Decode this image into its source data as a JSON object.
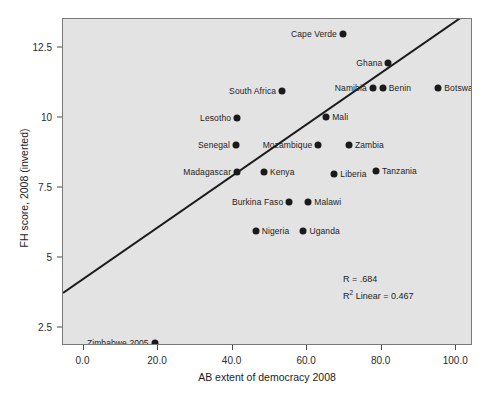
{
  "chart_data": {
    "type": "scatter",
    "title": "",
    "xlabel": "AB extent of democracy 2008",
    "ylabel": "FH score, 2008 (inverted)",
    "xlim": [
      -5.5,
      104.5
    ],
    "ylim": [
      1.85,
      13.55
    ],
    "grid": false,
    "legend": null,
    "xticks": [
      "0.0",
      "20.0",
      "40.0",
      "60.0",
      "80.0",
      "100.0"
    ],
    "xtick_values": [
      0,
      20,
      40,
      60,
      80,
      100
    ],
    "yticks": [
      "12.5",
      "10",
      "7.5",
      "5",
      "2.5"
    ],
    "ytick_values": [
      12.5,
      10,
      7.5,
      5,
      2.5
    ],
    "points": [
      {
        "label": "Cape Verde",
        "x": 69.6,
        "y": 13.03,
        "label_side": "left"
      },
      {
        "label": "Ghana",
        "x": 81.8,
        "y": 11.98,
        "label_side": "left"
      },
      {
        "label": "South Africa",
        "x": 53.3,
        "y": 10.97,
        "label_side": "left"
      },
      {
        "label": "Namibia",
        "x": 77.6,
        "y": 11.09,
        "label_side": "left"
      },
      {
        "label": "Benin",
        "x": 80.3,
        "y": 11.09,
        "label_side": "right"
      },
      {
        "label": "Botswana",
        "x": 95.2,
        "y": 11.09,
        "label_side": "right"
      },
      {
        "label": "Lesotho",
        "x": 41.2,
        "y": 10.0,
        "label_side": "left"
      },
      {
        "label": "Mali",
        "x": 65.1,
        "y": 10.04,
        "label_side": "right"
      },
      {
        "label": "Senegal",
        "x": 40.9,
        "y": 9.03,
        "label_side": "left"
      },
      {
        "label": "Mozambique",
        "x": 63.0,
        "y": 9.03,
        "label_side": "left"
      },
      {
        "label": "Zambia",
        "x": 71.2,
        "y": 9.03,
        "label_side": "right"
      },
      {
        "label": "Madagascar",
        "x": 41.2,
        "y": 8.06,
        "label_side": "left"
      },
      {
        "label": "Kenya",
        "x": 48.4,
        "y": 8.06,
        "label_side": "right"
      },
      {
        "label": "Liberia",
        "x": 67.3,
        "y": 8.02,
        "label_side": "right"
      },
      {
        "label": "Tanzania",
        "x": 78.5,
        "y": 8.1,
        "label_side": "right"
      },
      {
        "label": "Burkina Faso",
        "x": 55.2,
        "y": 7.02,
        "label_side": "left"
      },
      {
        "label": "Malawi",
        "x": 60.3,
        "y": 7.02,
        "label_side": "right"
      },
      {
        "label": "Nigeria",
        "x": 46.2,
        "y": 5.97,
        "label_side": "right"
      },
      {
        "label": "Uganda",
        "x": 59.0,
        "y": 5.97,
        "label_side": "right"
      },
      {
        "label": "Zimbabwe 2005",
        "x": 19.1,
        "y": 1.94,
        "label_side": "left"
      }
    ],
    "fit_line": {
      "type": "linear",
      "x_start": -5.5,
      "y_start": 3.69,
      "x_end": 104.5,
      "y_end": 13.85
    },
    "annotations": {
      "r_text": "R = .684",
      "r2_label": "R",
      "r2_sup": "2",
      "r2_text": " Linear = 0.467"
    }
  }
}
